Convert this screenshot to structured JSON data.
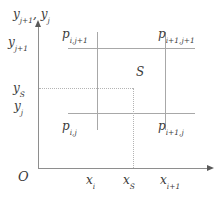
{
  "figure": {
    "background_color": "#ffffff",
    "line_color": "#a8a8a8",
    "axis_color": "#8e8e8e",
    "dotted_color": "#b4b4b4",
    "text_color": "#3a3a3a"
  },
  "axes": {
    "origin_label": "O",
    "y_axis_name": "y",
    "y_axis_name_sub_1": "j+1",
    "y_axis_name_sep": ", ",
    "y_axis_name_2": "y",
    "y_axis_name_sub_2": "j",
    "x_ticks": [
      {
        "base": "x",
        "sub": "i"
      },
      {
        "base": "x",
        "sub": "S"
      },
      {
        "base": "x",
        "sub": "i+1"
      }
    ],
    "y_ticks": [
      {
        "base": "y",
        "sub": "j+1"
      },
      {
        "base": "y",
        "sub": "S"
      },
      {
        "base": "y",
        "sub": "j"
      }
    ]
  },
  "points": {
    "corners": [
      {
        "name": "top-left",
        "base": "p",
        "sub": "i,j+1"
      },
      {
        "name": "top-right",
        "base": "p",
        "sub": "i+1,j+1"
      },
      {
        "name": "bottom-left",
        "base": "p",
        "sub": "i,j"
      },
      {
        "name": "bottom-right",
        "base": "p",
        "sub": "i+1,j"
      }
    ],
    "interpolation_point": "S"
  },
  "chart_data": {
    "type": "diagram",
    "title": "",
    "xlabel": "",
    "ylabel": "",
    "grid": true,
    "cell_x_bounds": [
      "x_i",
      "x_i+1"
    ],
    "cell_y_bounds": [
      "y_j",
      "y_j+1"
    ],
    "sample_point": {
      "label": "S",
      "x": "x_S",
      "y": "y_S"
    },
    "corner_nodes": [
      "p_i,j",
      "p_i+1,j",
      "p_i,j+1",
      "p_i+1,j+1"
    ]
  }
}
